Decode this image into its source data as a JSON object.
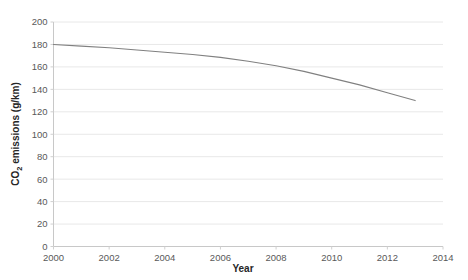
{
  "chart_data": {
    "type": "line",
    "title": "",
    "xlabel": "Year",
    "ylabel": "CO2 emissions (g/km)",
    "ylabel_parts": {
      "pre": "CO",
      "sub": "2",
      "post": " emissions (g/km)"
    },
    "xlim": [
      2000,
      2014
    ],
    "ylim": [
      0,
      200
    ],
    "xticks": [
      2000,
      2002,
      2004,
      2006,
      2008,
      2010,
      2012,
      2014
    ],
    "yticks": [
      0,
      20,
      40,
      60,
      80,
      100,
      120,
      140,
      160,
      180,
      200
    ],
    "grid": true,
    "grid_axis": "y",
    "legend": false,
    "series": [
      {
        "name": "CO2 emissions",
        "color": "#808080",
        "x": [
          2000,
          2001,
          2002,
          2003,
          2004,
          2005,
          2006,
          2007,
          2008,
          2009,
          2010,
          2011,
          2012,
          2013
        ],
        "values": [
          180,
          178.5,
          177,
          175,
          173,
          171,
          168.5,
          165,
          161,
          156,
          150,
          144,
          137,
          130
        ]
      }
    ]
  },
  "axes": {
    "x_tick_labels": [
      "2000",
      "2002",
      "2004",
      "2006",
      "2008",
      "2010",
      "2012",
      "2014"
    ],
    "y_tick_labels": [
      "0",
      "20",
      "40",
      "60",
      "80",
      "100",
      "120",
      "140",
      "160",
      "180",
      "200"
    ],
    "x_title": "Year",
    "y_title_pre": "CO",
    "y_title_sub": "2",
    "y_title_post": " emissions (g/km)"
  },
  "colors": {
    "line": "#808080",
    "grid": "#e8e8e8",
    "axis": "#d0d0d0",
    "tick_text": "#595959",
    "title_text": "#262626",
    "background": "#ffffff"
  }
}
